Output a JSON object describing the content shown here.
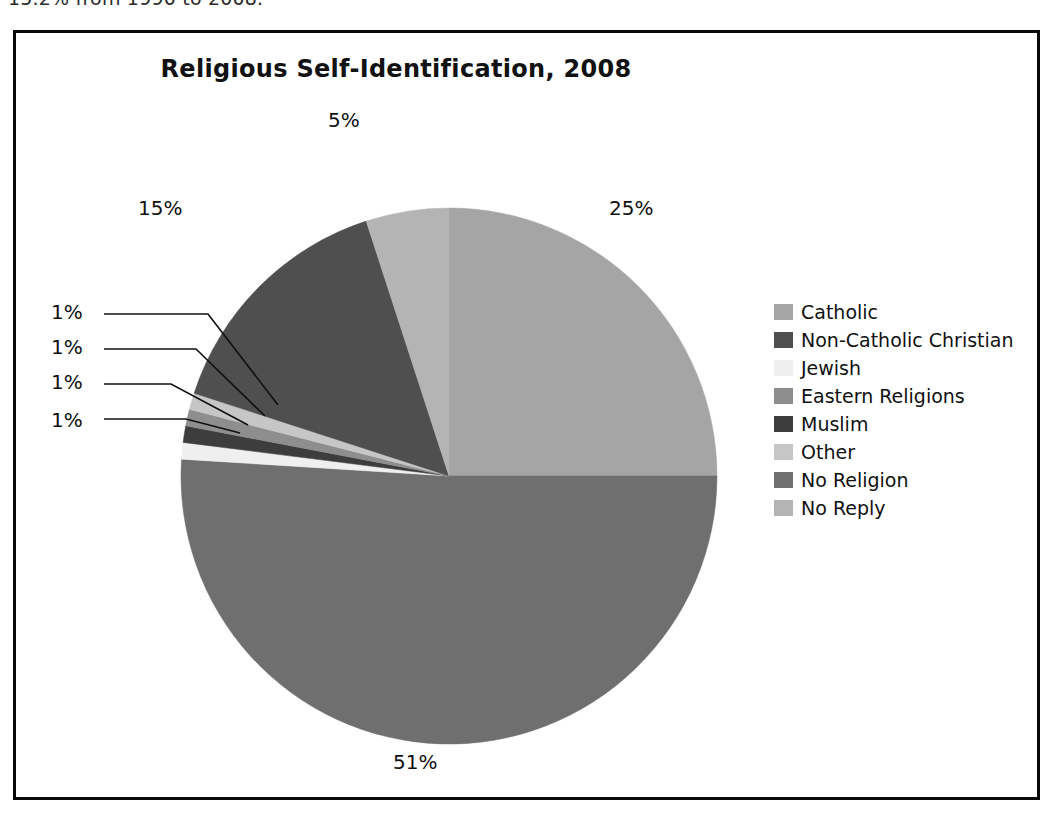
{
  "page_text": "15.2% from 1990 to 2008.",
  "figure": {
    "title": "Religious Self-Identification, 2008"
  },
  "chart_data": {
    "type": "pie",
    "title": "Religious Self-Identification, 2008",
    "xlabel": "",
    "ylabel": "",
    "unit": "%",
    "legend_position": "right",
    "grid": false,
    "start_angle_deg": 0,
    "direction": "clockwise",
    "categories": [
      "Catholic",
      "Non-Catholic Christian",
      "Jewish",
      "Eastern Religions",
      "Muslim",
      "Other",
      "No Religion",
      "No Reply"
    ],
    "values": [
      25,
      15,
      1,
      1,
      1,
      1,
      51,
      5
    ],
    "data_labels": [
      "25%",
      "15%",
      "1%",
      "1%",
      "1%",
      "1%",
      "51%",
      "5%"
    ],
    "colors": [
      "#a5a5a5",
      "#4f4f4f",
      "#efefef",
      "#8e8e8e",
      "#3d3d3d",
      "#c6c6c6",
      "#6f6f6f",
      "#b4b4b4"
    ],
    "slices": [
      {
        "label": "Catholic",
        "value": 25,
        "data_label": "25%",
        "color": "#a5a5a5"
      },
      {
        "label": "No Religion",
        "value": 51,
        "data_label": "51%",
        "color": "#6f6f6f"
      },
      {
        "label": "Jewish",
        "value": 1,
        "data_label": "1%",
        "color": "#efefef"
      },
      {
        "label": "Muslim",
        "value": 1,
        "data_label": "1%",
        "color": "#3d3d3d"
      },
      {
        "label": "Eastern Religions",
        "value": 1,
        "data_label": "1%",
        "color": "#8e8e8e"
      },
      {
        "label": "Other",
        "value": 1,
        "data_label": "1%",
        "color": "#c6c6c6"
      },
      {
        "label": "Non-Catholic Christian",
        "value": 15,
        "data_label": "15%",
        "color": "#4f4f4f"
      },
      {
        "label": "No Reply",
        "value": 5,
        "data_label": "5%",
        "color": "#b4b4b4"
      }
    ]
  },
  "labels": {
    "pct_25": "25%",
    "pct_5": "5%",
    "pct_15": "15%",
    "pct_51": "51%",
    "pct_1_a": "1%",
    "pct_1_b": "1%",
    "pct_1_c": "1%",
    "pct_1_d": "1%"
  },
  "legend": {
    "items": [
      {
        "label": "Catholic",
        "color": "#a5a5a5"
      },
      {
        "label": "Non-Catholic Christian",
        "color": "#4f4f4f"
      },
      {
        "label": "Jewish",
        "color": "#efefef"
      },
      {
        "label": "Eastern Religions",
        "color": "#8e8e8e"
      },
      {
        "label": "Muslim",
        "color": "#3d3d3d"
      },
      {
        "label": "Other",
        "color": "#c6c6c6"
      },
      {
        "label": "No Religion",
        "color": "#6f6f6f"
      },
      {
        "label": "No Reply",
        "color": "#b4b4b4"
      }
    ]
  }
}
